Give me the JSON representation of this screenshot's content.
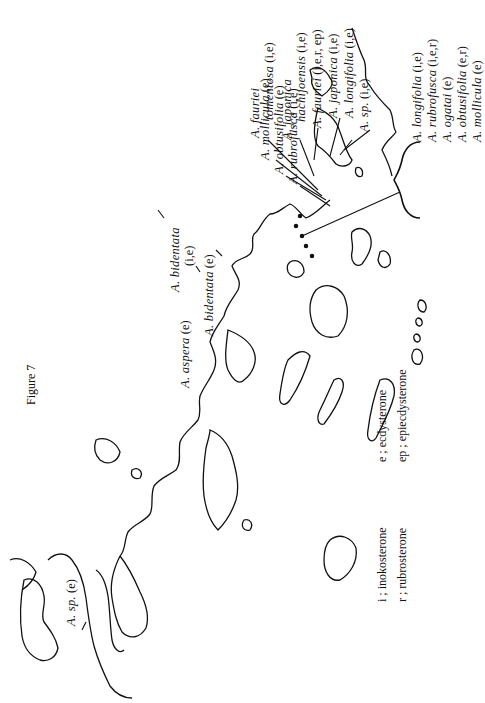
{
  "figure": {
    "title": "Figure 7"
  },
  "labels": {
    "sp_ie": {
      "name": "A. sp.",
      "code": "(i,e)"
    },
    "longifolia": {
      "name": "A. longifolia",
      "code": "(i,e)"
    },
    "japonica": {
      "name": "A. japonica",
      "code": "(i,e)"
    },
    "fauriei": {
      "name": "A. fauriei",
      "code": "(i,e,r, ep)"
    },
    "japonica_hachijoensis": {
      "name1": "A. japonica",
      "name2": "hachijoensis",
      "code": "(i,e)"
    },
    "fauriei_tomentosa": {
      "name1": "A. fauriei",
      "name2": "tomentosa",
      "code": "(i,e)"
    },
    "mollicula": {
      "name": "A. mollicula",
      "code": "(e)"
    },
    "obtusifolia": {
      "name": "A. obtusifolia",
      "code": "(e)"
    },
    "rubrofusca": {
      "name": "A. rubrofusca",
      "code": "(i,e)"
    },
    "group": [
      {
        "name": "A. longifolia",
        "code": "(i,e)"
      },
      {
        "name": "A. rubrofusca",
        "code": "(i,e,r)"
      },
      {
        "name": "A. ogatai",
        "code": "(e)"
      },
      {
        "name": "A. obtusifolia",
        "code": "(e,r)"
      },
      {
        "name": "A. mollicula",
        "code": "(e)"
      }
    ],
    "bidentata_ie": {
      "name": "A. bidentata",
      "code": "(i,e)"
    },
    "bidentata_e": {
      "name": "A. bidentata",
      "code": "(e)"
    },
    "aspera": {
      "name": "A. aspera",
      "code": "(e)"
    },
    "sp_e": {
      "name": "A. sp.",
      "code": "(e)"
    }
  },
  "legend": {
    "rows": [
      {
        "left": "i ; inokosterone",
        "right": "e ; ecdysterone"
      },
      {
        "left": "r ; rubrosterone",
        "right": "ep ; epiecdysterone"
      }
    ]
  }
}
